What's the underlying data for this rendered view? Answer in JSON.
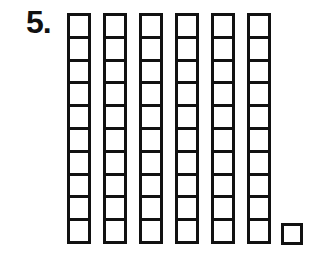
{
  "problem": {
    "number_label": "5.",
    "ten_rods": 6,
    "cubes_per_rod": 10,
    "single_cubes": 1,
    "represented_value": 61
  },
  "colors": {
    "stroke": "#111111",
    "background": "#ffffff"
  }
}
